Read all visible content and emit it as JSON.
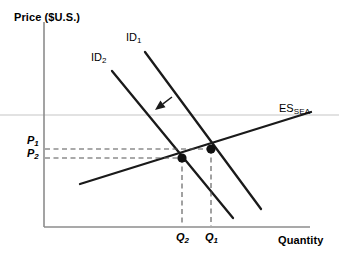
{
  "figure": {
    "type": "economics-supply-demand-diagram",
    "background_color": "#ffffff",
    "line_color": "#1a1a1a",
    "axis_color": "#8c8c8c",
    "dash_color": "#555555"
  },
  "axes": {
    "y_title": "Price ($U.S.)",
    "x_title": "Quantity",
    "origin": {
      "x": 44,
      "y": 227
    },
    "y_axis_top": 22,
    "x_axis_right": 310
  },
  "price_ticks": [
    {
      "label_main": "P",
      "label_sub": "1",
      "y": 141,
      "x_text": 27
    },
    {
      "label_main": "P",
      "label_sub": "2",
      "y": 153,
      "x_text": 27
    }
  ],
  "quantity_ticks": [
    {
      "label_main": "Q",
      "label_sub": "2",
      "x": 182,
      "y_text": 232
    },
    {
      "label_main": "Q",
      "label_sub": "1",
      "x": 211,
      "y_text": 232
    }
  ],
  "curves": [
    {
      "name": "import-demand-1",
      "label_main": "ID",
      "label_sub": "1",
      "label_x": 126,
      "label_y": 38,
      "x1": 145,
      "y1": 52,
      "x2": 261,
      "y2": 209
    },
    {
      "name": "import-demand-2",
      "label_main": "ID",
      "label_sub": "2",
      "label_x": 91,
      "label_y": 58,
      "x1": 112,
      "y1": 71,
      "x2": 233,
      "y2": 218
    },
    {
      "name": "export-supply-sea",
      "label_main": "ES",
      "label_sub": "SEA",
      "label_x": 279,
      "label_y": 108,
      "x1": 80,
      "y1": 184,
      "x2": 311,
      "y2": 112
    }
  ],
  "equilibria": [
    {
      "name": "equilibrium-1",
      "x": 211,
      "y": 149,
      "price_label": "P1",
      "quantity_label": "Q1"
    },
    {
      "name": "equilibrium-2",
      "x": 182,
      "y": 158,
      "price_label": "P2",
      "quantity_label": "Q2"
    }
  ],
  "shift_arrow": {
    "name": "demand-shift-arrow",
    "from_x": 172,
    "from_y": 97,
    "to_x": 155,
    "to_y": 110
  },
  "guide_line": {
    "name": "horizontal-guide",
    "y": 115,
    "x1": 0,
    "x2": 339
  }
}
